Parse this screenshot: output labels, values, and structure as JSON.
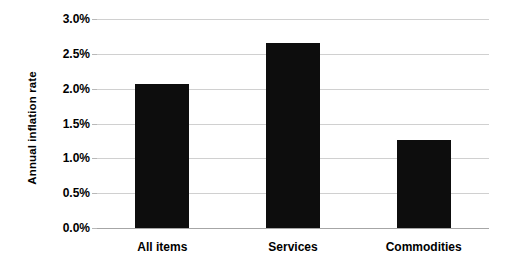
{
  "chart_data": {
    "type": "bar",
    "title": "",
    "subtitle": "",
    "xlabel": "",
    "ylabel": "Annual inflation rate",
    "categories": [
      "All items",
      "Services",
      "Commodities"
    ],
    "values": [
      2.07,
      2.65,
      1.27
    ],
    "value_labels": [
      "2.07%",
      "2.65%",
      "1.27%"
    ],
    "series": [
      {
        "name": "Annual inflation rate",
        "values": [
          2.07,
          2.65,
          1.27
        ]
      }
    ],
    "ylim": [
      0.0,
      3.0
    ],
    "ytick_values": [
      3.0,
      2.5,
      2.0,
      1.5,
      1.0,
      0.5,
      0.0
    ],
    "ytick_labels": [
      "3.0%",
      "2.5%",
      "2.0%",
      "1.5%",
      "1.0%",
      "0.5%",
      "0.0%"
    ],
    "grid": "horizontal",
    "legend": "none",
    "bar_color": "#0d0d0d",
    "gridline_color": "#d0d0d0",
    "axis_color": "#a6a6a6",
    "background_color": "#ffffff",
    "annotations": []
  }
}
